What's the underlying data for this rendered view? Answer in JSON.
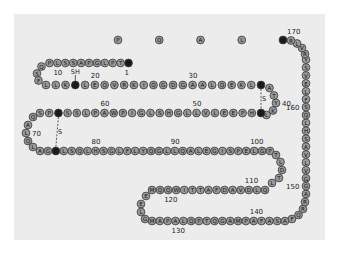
{
  "figure": {
    "title": "",
    "sequence": "MTPLGPASSLPQSFLLKCLEQVRKIQGDGAALQEKLCATYKLCHPEELVLLGHSLGIPWAPLSSCPSQALQLAGCLSQLHSGLFLYQGLLQALEGISPELGPTLDTLQLDVADFATTIWQQMEELGMAPALQPTQGAMPAFASAFQRRAGGVLVASHLQSFLEVSYRVLRHLAQP",
    "highlighted_residues": [
      1,
      18,
      37,
      43,
      65,
      75,
      171
    ],
    "free_thiol": {
      "residue": 18,
      "label": "SH"
    },
    "disulfide_bonds": [
      {
        "from": 37,
        "to": 43,
        "label": "S–S"
      },
      {
        "from": 65,
        "to": 75,
        "label": "S–S"
      }
    ],
    "position_labels": [
      "1",
      "10",
      "20",
      "30",
      "40",
      "50",
      "60",
      "70",
      "80",
      "90",
      "100",
      "110",
      "120",
      "130",
      "140",
      "150",
      "160",
      "170"
    ],
    "colors": {
      "background": "#ececec",
      "residue_fill": "#9a9a9a",
      "highlight_fill": "#1e1e1e",
      "outline": "#3a3a3a"
    }
  }
}
